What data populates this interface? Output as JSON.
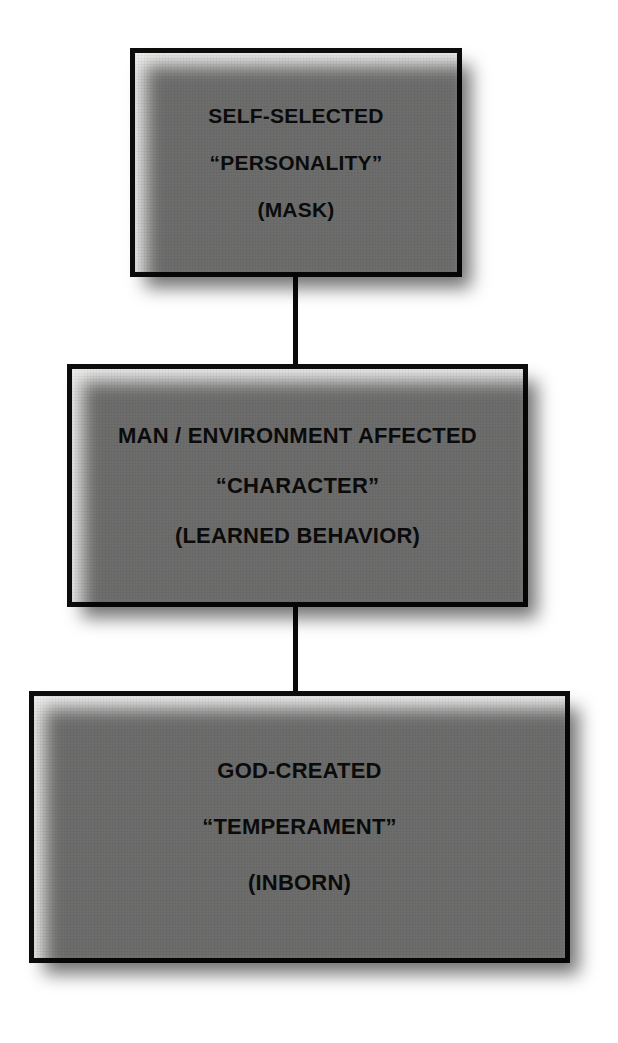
{
  "diagram": {
    "background_color": "#ffffff",
    "box_fill_color": "#f1f1f0",
    "box_border_color": "#0d0d0d",
    "text_color": "#0b0b0b",
    "nodes": [
      {
        "id": "personality",
        "lines": [
          "SELF-SELECTED",
          "“PERSONALITY”",
          "(MASK)"
        ]
      },
      {
        "id": "character",
        "lines": [
          "MAN / ENVIRONMENT AFFECTED",
          "“CHARACTER”",
          "(LEARNED BEHAVIOR)"
        ]
      },
      {
        "id": "temperament",
        "lines": [
          "GOD-CREATED",
          "“TEMPERAMENT”",
          "(INBORN)"
        ]
      }
    ],
    "connectors": [
      {
        "id": "connector-1",
        "from": "personality",
        "to": "character"
      },
      {
        "id": "connector-2",
        "from": "character",
        "to": "temperament"
      }
    ]
  }
}
